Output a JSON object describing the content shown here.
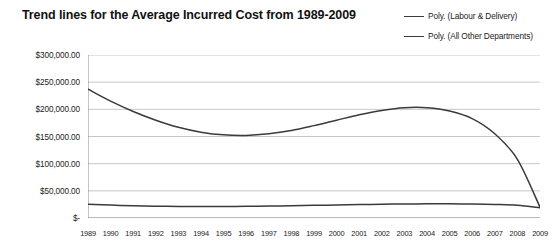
{
  "title": "Trend lines for the Average Incurred Cost from 1989-2009",
  "legend": {
    "position": "top-right",
    "items": [
      {
        "label": "Poly. (Labour & Delivery)",
        "color": "#3a3a3a",
        "swatch": "line-swatch-icon"
      },
      {
        "label": "Poly. (All Other Departments)",
        "color": "#3a3a3a",
        "swatch": "line-swatch-icon"
      }
    ]
  },
  "axis": {
    "y_ticks": [
      "$-",
      "$50,000.00",
      "$100,000.00",
      "$150,000.00",
      "$200,000.00",
      "$250,000.00",
      "$300,000.00"
    ],
    "x_ticks": [
      "1989",
      "1990",
      "1991",
      "1992",
      "1993",
      "1994",
      "1995",
      "1996",
      "1997",
      "1998",
      "1999",
      "2000",
      "2001",
      "2002",
      "2003",
      "2004",
      "2005",
      "2006",
      "2007",
      "2008",
      "2009"
    ]
  },
  "chart_data": {
    "type": "line",
    "title": "Trend lines for the Average Incurred Cost from 1989-2009",
    "xlabel": "",
    "ylabel": "",
    "ylim": [
      0,
      300000
    ],
    "xlim": [
      "1989",
      "2009"
    ],
    "grid": true,
    "legend_position": "top-right",
    "categories": [
      "1989",
      "1990",
      "1991",
      "1992",
      "1993",
      "1994",
      "1995",
      "1996",
      "1997",
      "1998",
      "1999",
      "2000",
      "2001",
      "2002",
      "2003",
      "2004",
      "2005",
      "2006",
      "2007",
      "2008",
      "2009"
    ],
    "series": [
      {
        "name": "Poly. (Labour & Delivery)",
        "color": "#3a3a3a",
        "values": [
          237000,
          215000,
          196000,
          180000,
          167000,
          158000,
          153000,
          152000,
          155000,
          161000,
          170000,
          180000,
          190000,
          198000,
          203000,
          203000,
          197000,
          183000,
          155000,
          108000,
          20000
        ]
      },
      {
        "name": "Poly. (All Other Departments)",
        "color": "#3a3a3a",
        "values": [
          25500,
          23800,
          22600,
          21800,
          21300,
          21100,
          21200,
          21500,
          22000,
          22600,
          23300,
          24000,
          24700,
          25300,
          25800,
          26100,
          26100,
          25800,
          25000,
          23500,
          19000
        ]
      }
    ]
  }
}
